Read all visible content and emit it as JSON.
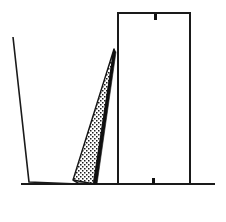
{
  "figure": {
    "title": "Leaning slab and upright block, vintage engraving",
    "background_color": "#ffffff",
    "ink_color": "#1a1a1a",
    "width": 226,
    "height": 222,
    "caption": ""
  },
  "elements": {
    "ground_line": {
      "name": "ground-line",
      "description": "horizontal baseline",
      "x1": 21,
      "y1": 184,
      "x2": 215,
      "y2": 184,
      "stroke_width": 2.0,
      "color": "#1a1a1a"
    },
    "left_slab": {
      "name": "left-slab",
      "description": "tilted left panel leaning away, open outline",
      "top_x": 13,
      "top_y": 37,
      "bottom_x": 29,
      "bottom_y": 182,
      "base_end_x": 78,
      "base_end_y": 184,
      "color": "#1a1a1a"
    },
    "stippled_wedge": {
      "name": "stippled-wedge",
      "description": "narrow tapering wedge with stipple texture, apex at top",
      "apex_x": 114,
      "apex_y": 49,
      "base_left_x": 73,
      "base_left_y": 180,
      "base_right_x": 94,
      "base_right_y": 184,
      "fill": "stipple",
      "edge_color": "#101010"
    },
    "plumb_line": {
      "name": "plumb-line-dashed",
      "description": "vertical dashed reference line",
      "x": 118,
      "y_top": 46,
      "y_bottom": 184,
      "dash_on": 4.5,
      "dash_off": 4.0,
      "color": "#111111"
    },
    "right_block": {
      "name": "right-block",
      "description": "upright rectangular block standing on ground",
      "left": 118,
      "top": 13,
      "right": 190,
      "bottom": 184,
      "stroke_width": 2.0,
      "color": "#1a1a1a"
    },
    "top_tick": {
      "name": "top-center-tick",
      "description": "small notch hanging below top edge of block",
      "x": 154,
      "y": 14,
      "width": 3,
      "height": 6,
      "color": "#111111"
    },
    "bottom_tick": {
      "name": "bottom-center-tick",
      "description": "small notch above bottom edge of block",
      "x": 152,
      "y": 178,
      "width": 3,
      "height": 6,
      "color": "#111111"
    }
  },
  "labels": {
    "none_visible": ""
  }
}
